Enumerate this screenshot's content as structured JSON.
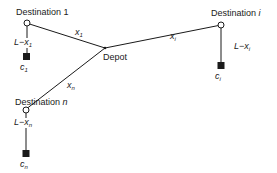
{
  "diagram": {
    "colors": {
      "line": "#1a1a1a",
      "node_fill": "#ffffff",
      "square_fill": "#1a1a1a",
      "background": "#ffffff"
    },
    "depot": {
      "label": "Depot",
      "x": 105,
      "y": 48
    },
    "destinations": [
      {
        "id": "dest-1",
        "label": "Destination 1",
        "edge_var": "x",
        "edge_sub": "1",
        "remaining_prefix": "L−",
        "remaining_var": "x",
        "remaining_sub": "1",
        "cost_var": "c",
        "cost_sub": "1",
        "node": {
          "x": 27,
          "y": 23
        },
        "square": {
          "x": 26,
          "y": 56
        }
      },
      {
        "id": "dest-i",
        "label": "Destination i",
        "edge_var": "x",
        "edge_sub": "i",
        "remaining_prefix": "L−",
        "remaining_var": "x",
        "remaining_sub": "i",
        "cost_var": "c",
        "cost_sub": "i",
        "node": {
          "x": 221,
          "y": 25
        },
        "square": {
          "x": 221,
          "y": 65
        }
      },
      {
        "id": "dest-n",
        "label": "Destination n",
        "edge_var": "x",
        "edge_sub": "n",
        "remaining_prefix": "L−",
        "remaining_var": "x",
        "remaining_sub": "n",
        "cost_var": "c",
        "cost_sub": "n",
        "node": {
          "x": 26,
          "y": 110
        },
        "square": {
          "x": 26,
          "y": 153
        }
      }
    ],
    "label_parts": {
      "dest1_name": "Destination",
      "dest1_num": "1",
      "desti_name": "Destination",
      "desti_num": "i",
      "destn_name": "Destination",
      "destn_num": "n"
    }
  }
}
